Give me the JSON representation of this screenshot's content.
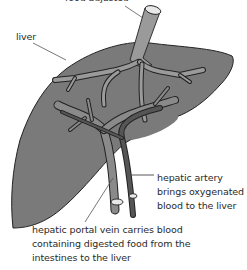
{
  "diagram": {
    "colors": {
      "liver_fill": "#7a7a7a",
      "liver_outline": "#222222",
      "vessel_fill": "#9a9a9a",
      "artery_fill": "#555555",
      "leader_line": "#555555",
      "text": "#2a2a2a"
    },
    "labels": {
      "top": "food adjusted",
      "liver": "liver",
      "hepatic_artery": [
        "hepatic artery",
        "brings oxygenated",
        "blood to the liver"
      ],
      "hepatic_portal_vein": [
        "hepatic portal vein carries blood",
        "containing digested food from the",
        "intestines to the liver"
      ]
    }
  }
}
